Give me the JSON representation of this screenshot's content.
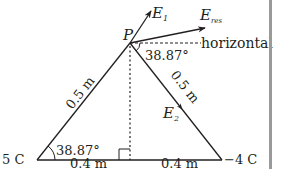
{
  "diagram": {
    "point_label": "P",
    "charges": {
      "left": "5 C",
      "right": "−4 C"
    },
    "lengths": {
      "left_side": "0.5 m",
      "right_side": "0.5 m",
      "base_left": "0.4 m",
      "base_right": "0.4 m"
    },
    "angles": {
      "base_angle": "38.87°",
      "top_angle": "38.87°"
    },
    "vectors": {
      "e1": {
        "main": "E",
        "sub": "1"
      },
      "e2": {
        "main": "E",
        "sub": "2"
      },
      "eres": {
        "main": "E",
        "sub": "res"
      }
    },
    "reference_label": "horizontal",
    "colors": {
      "ink": "#231f20",
      "border": "#9a9a9a"
    }
  }
}
